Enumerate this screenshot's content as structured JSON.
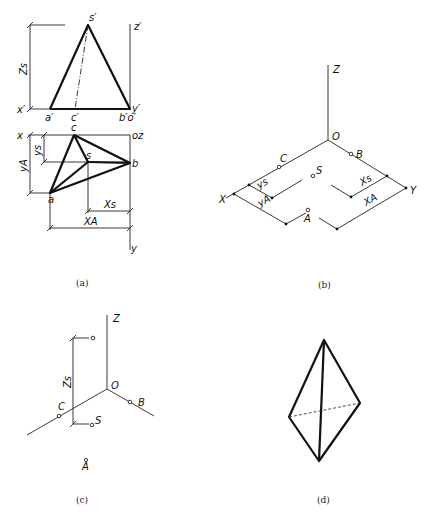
{
  "figure_a": {
    "caption": "(a)",
    "front_view_labels": {
      "s_prime": "s′",
      "z_prime": "z′",
      "x_prime": "x′",
      "a_prime": "a′",
      "c_prime": "c′",
      "b_prime_o_prime": "b′o′",
      "y_prime": "y′",
      "zs": "Zs"
    },
    "top_view_labels": {
      "x": "x",
      "oz": "oz",
      "c": "c",
      "s": "s",
      "b": "b",
      "a": "a",
      "ys": "ys",
      "ya": "yA",
      "xs": "Xs",
      "xa": "XA",
      "y": "y"
    }
  },
  "figure_b": {
    "caption": "(b)",
    "labels": {
      "z": "Z",
      "o": "O",
      "c": "C",
      "b": "B",
      "s": "S",
      "x": "X",
      "y": "Y",
      "a": "A",
      "ys": "ys",
      "ya": "yA",
      "xs": "Xs",
      "xa": "XA"
    }
  },
  "figure_c": {
    "caption": "(c)",
    "labels": {
      "z": "Z",
      "o": "O",
      "c": "C",
      "b": "B",
      "s": "S",
      "a": "A",
      "zs": "Zs"
    }
  },
  "figure_d": {
    "caption": "(d)"
  }
}
